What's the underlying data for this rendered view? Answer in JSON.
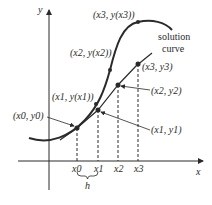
{
  "diagram": {
    "axes": {
      "x_label": "x",
      "y_label": "y"
    },
    "curve_label_line1": "solution",
    "curve_label_line2": "curve",
    "points": {
      "p0": "(x0, y0)",
      "x1_true": "(x1, y(x1))",
      "x2_true": "(x2, y(x2))",
      "x3_true": "(x3, y(x3))",
      "p1": "(x1, y1)",
      "p2": "(x2, y2)",
      "p3": "(x3, y3)"
    },
    "ticks": [
      "x0",
      "x1",
      "x2",
      "x3"
    ],
    "step_label": "h",
    "colors": {
      "ink": "#2a2a2a",
      "background": "#ffffff"
    }
  }
}
